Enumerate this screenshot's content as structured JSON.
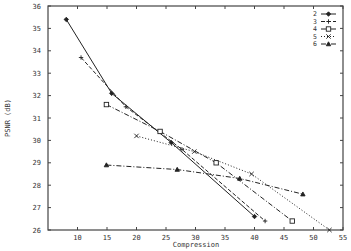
{
  "chart_data": {
    "type": "line",
    "title": "",
    "xlabel": "Compression",
    "ylabel": "PSNR (dB)",
    "xlim": [
      5,
      55
    ],
    "ylim": [
      26,
      36
    ],
    "xticks": [
      10,
      15,
      20,
      25,
      30,
      35,
      40,
      45,
      50,
      55
    ],
    "yticks": [
      26,
      27,
      28,
      29,
      30,
      31,
      32,
      33,
      34,
      35,
      36
    ],
    "grid": false,
    "legend_position": "upper right",
    "series": [
      {
        "name": "2",
        "marker": "diamond",
        "linestyle": "solid",
        "x": [
          8.1,
          15.8,
          25.9,
          40.0
        ],
        "y": [
          35.4,
          32.1,
          29.9,
          26.6
        ]
      },
      {
        "name": "3",
        "marker": "plus",
        "linestyle": "dashed",
        "x": [
          10.6,
          18.2,
          27.7,
          41.8
        ],
        "y": [
          33.7,
          31.5,
          29.6,
          26.4
        ]
      },
      {
        "name": "4",
        "marker": "square",
        "linestyle": "dash-dot",
        "x": [
          14.9,
          24.0,
          33.5,
          46.4
        ],
        "y": [
          31.6,
          30.4,
          29.0,
          26.4
        ]
      },
      {
        "name": "5",
        "marker": "x",
        "linestyle": "dotted",
        "x": [
          20.0,
          29.8,
          39.5,
          52.7
        ],
        "y": [
          30.2,
          29.5,
          28.5,
          26.0
        ]
      },
      {
        "name": "6",
        "marker": "triangle",
        "linestyle": "dash-dot",
        "x": [
          14.9,
          26.9,
          37.5,
          48.2
        ],
        "y": [
          28.9,
          28.7,
          28.3,
          27.6
        ]
      }
    ]
  },
  "colors": {
    "axis": "#444444",
    "line": "#222222",
    "background": "#ffffff"
  }
}
